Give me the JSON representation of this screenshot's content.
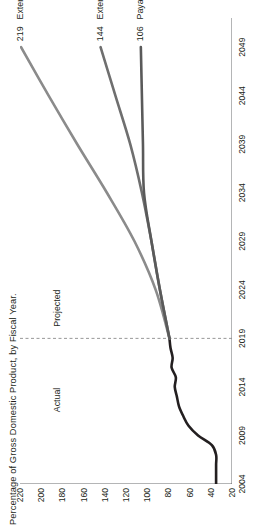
{
  "figure": {
    "axis_title": "Percentage of Gross Domestic Product, by Fiscal Year.",
    "period_actual": "Actual",
    "period_projected": "Projected",
    "divider_year": 2019
  },
  "chart_data": {
    "type": "line",
    "title": "Percentage of Gross Domestic Product, by Fiscal Year.",
    "xlabel": "",
    "ylabel": "Percentage of Gross Domestic Product",
    "orientation": "rotated-90-ccw",
    "grid": false,
    "legend_position": "end-of-line",
    "xlim": [
      2004,
      2052
    ],
    "ylim": [
      20,
      220
    ],
    "xticks": [
      2004,
      2009,
      2014,
      2019,
      2024,
      2029,
      2034,
      2039,
      2044,
      2049
    ],
    "yticks": [
      20,
      40,
      60,
      80,
      100,
      120,
      140,
      160,
      180,
      200,
      220
    ],
    "annotations": [
      {
        "text": "Actual",
        "x": 2012
      },
      {
        "text": "Projected",
        "x": 2023
      },
      {
        "text": "divider",
        "x": 2019,
        "style": "dashed-vertical"
      }
    ],
    "series": [
      {
        "name": "Actual",
        "color": "#231f20",
        "end_value": null,
        "x": [
          2004,
          2005,
          2006,
          2007,
          2008,
          2009,
          2010,
          2011,
          2012,
          2013,
          2014,
          2015,
          2016,
          2017,
          2018,
          2019
        ],
        "values": [
          35,
          35,
          35,
          35,
          39,
          52,
          61,
          66,
          70,
          72,
          74,
          73,
          77,
          76,
          78,
          79
        ]
      },
      {
        "name": "Extended alternative fiscal scenario",
        "color": "#8b8b8b",
        "end_value": 219,
        "end_label": "219",
        "x": [
          2019,
          2024,
          2029,
          2034,
          2039,
          2044,
          2049
        ],
        "values": [
          79,
          92,
          112,
          138,
          166,
          193,
          219
        ]
      },
      {
        "name": "Extended baseline",
        "color": "#6f6f6f",
        "end_value": 144,
        "end_label": "144",
        "x": [
          2019,
          2024,
          2029,
          2034,
          2039,
          2044,
          2049
        ],
        "values": [
          79,
          88,
          96,
          105,
          116,
          130,
          144
        ]
      },
      {
        "name": "Payable benefits scenario",
        "color": "#5a5a5a",
        "end_value": 106,
        "end_label": "106",
        "x": [
          2019,
          2024,
          2029,
          2034,
          2039,
          2044,
          2049
        ],
        "values": [
          79,
          88,
          96,
          103,
          104,
          105,
          106
        ]
      }
    ]
  },
  "colors": {
    "actual": "#231f20",
    "alt_fiscal": "#8b8b8b",
    "baseline": "#6f6f6f",
    "payable": "#5a5a5a",
    "axis": "#58595b",
    "divider": "#8c8c8c",
    "background": "#ffffff"
  }
}
